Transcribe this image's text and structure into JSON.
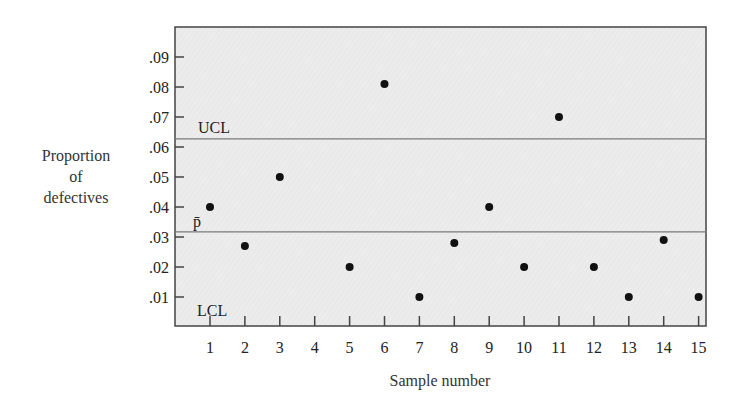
{
  "chart_data": {
    "type": "scatter",
    "title": "",
    "xlabel": "Sample number",
    "ylabel": "Proportion of defectives",
    "ylabel_lines": [
      "Proportion",
      "of",
      "defectives"
    ],
    "x_ticks": [
      1,
      2,
      3,
      4,
      5,
      6,
      7,
      8,
      9,
      10,
      11,
      12,
      13,
      14,
      15
    ],
    "y_ticks": [
      ".01",
      ".02",
      ".03",
      ".04",
      ".05",
      ".06",
      ".07",
      ".08",
      ".09"
    ],
    "y_tick_values": [
      0.01,
      0.02,
      0.03,
      0.04,
      0.05,
      0.06,
      0.07,
      0.08,
      0.09
    ],
    "ylim": [
      0,
      0.1
    ],
    "xlim": [
      0,
      15.8
    ],
    "grid": false,
    "points": [
      {
        "x": 1,
        "y": 0.04
      },
      {
        "x": 2,
        "y": 0.027
      },
      {
        "x": 3,
        "y": 0.05
      },
      {
        "x": 5,
        "y": 0.02
      },
      {
        "x": 6,
        "y": 0.081
      },
      {
        "x": 7,
        "y": 0.01
      },
      {
        "x": 8,
        "y": 0.028
      },
      {
        "x": 9,
        "y": 0.04
      },
      {
        "x": 10,
        "y": 0.02
      },
      {
        "x": 11,
        "y": 0.07
      },
      {
        "x": 12,
        "y": 0.02
      },
      {
        "x": 13,
        "y": 0.01
      },
      {
        "x": 14,
        "y": 0.029
      },
      {
        "x": 15,
        "y": 0.01
      }
    ],
    "control_lines": [
      {
        "name": "UCL",
        "label": "UCL",
        "y": 0.0627
      },
      {
        "name": "center",
        "label": "p̄",
        "y": 0.0317
      },
      {
        "name": "LCL",
        "label": "LCL",
        "y": 0.0
      }
    ],
    "colors": {
      "plot_background": "#ebebeb",
      "point": "#111111",
      "line": "#7a7a7a",
      "frame": "#444444"
    }
  }
}
